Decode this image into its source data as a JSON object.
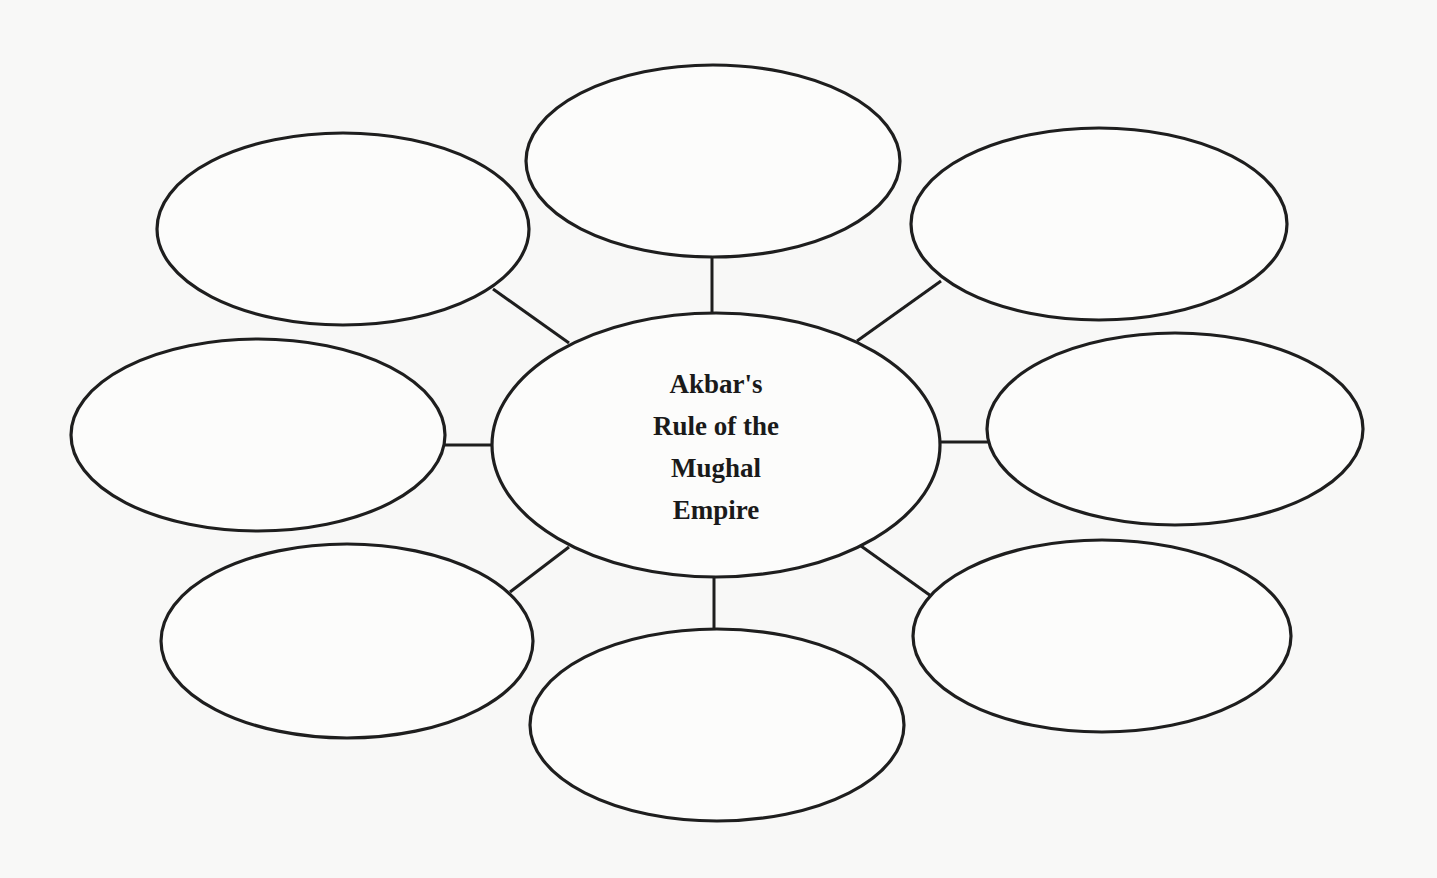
{
  "diagram": {
    "type": "bubble-map",
    "center": {
      "title_lines": [
        "Akbar's",
        "Rule of the",
        "Mughal",
        "Empire"
      ],
      "title": "Akbar's Rule of the Mughal Empire"
    },
    "nodes": [
      {
        "id": "top",
        "label": ""
      },
      {
        "id": "top-right",
        "label": ""
      },
      {
        "id": "right",
        "label": ""
      },
      {
        "id": "bottom-right",
        "label": ""
      },
      {
        "id": "bottom",
        "label": ""
      },
      {
        "id": "bottom-left",
        "label": ""
      },
      {
        "id": "left",
        "label": ""
      },
      {
        "id": "top-left",
        "label": ""
      }
    ],
    "colors": {
      "background": "#f8f8f7",
      "stroke": "#1e1e1e",
      "text": "#1a1a1a"
    }
  }
}
